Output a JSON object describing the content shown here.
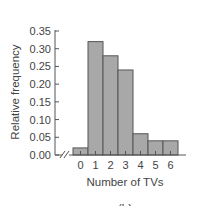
{
  "chart_data": {
    "type": "bar",
    "title": "",
    "caption": "(b)",
    "xlabel": "Number of TVs",
    "ylabel": "Relative frequency",
    "categories": [
      "0",
      "1",
      "2",
      "3",
      "4",
      "5",
      "6"
    ],
    "values": [
      0.02,
      0.32,
      0.28,
      0.24,
      0.06,
      0.04,
      0.04
    ],
    "ylim": [
      0,
      0.35
    ],
    "yticks": [
      "0.00",
      "0.05",
      "0.10",
      "0.15",
      "0.20",
      "0.25",
      "0.30",
      "0.35"
    ],
    "grid": false,
    "legend": null,
    "axis_break": true,
    "bar_color": "#a8a8a8",
    "bar_edge_color": "#555555"
  }
}
